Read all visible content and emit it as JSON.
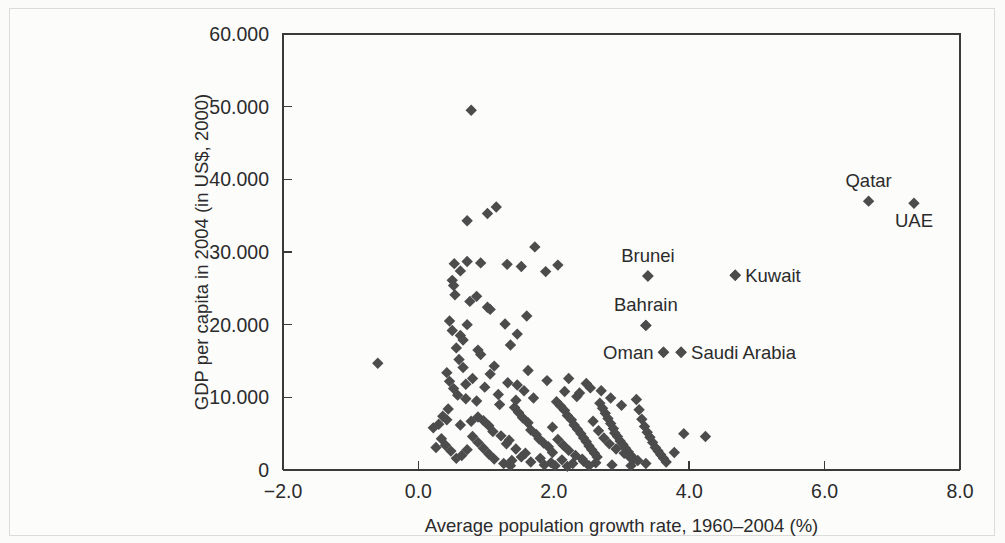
{
  "chart_data": {
    "type": "scatter",
    "title": "",
    "xlabel": "Average population growth rate, 1960–2004 (%)",
    "ylabel": "GDP per capita in 2004 (in US$, 2000)",
    "xlim": [
      -2.0,
      8.0
    ],
    "ylim": [
      0,
      60000
    ],
    "xticks": [
      -2.0,
      0.0,
      2.0,
      4.0,
      6.0,
      8.0
    ],
    "xtick_labels": [
      "−2.0",
      "0.0",
      "2.0",
      "4.0",
      "6.0",
      "8.0"
    ],
    "yticks": [
      0,
      10000,
      20000,
      30000,
      40000,
      50000,
      60000
    ],
    "ytick_labels": [
      "0",
      "10.000",
      "20.000",
      "30.000",
      "40.000",
      "50.000",
      "60.000"
    ],
    "grid": false,
    "legend": "none",
    "marker": "diamond",
    "marker_color": "#4c4c4c",
    "marker_size": 9,
    "annotations": [
      {
        "label": "Qatar",
        "x": 6.65,
        "y": 37000,
        "position": "above"
      },
      {
        "label": "UAE",
        "x": 7.32,
        "y": 36700,
        "position": "below"
      },
      {
        "label": "Brunei",
        "x": 3.39,
        "y": 26700,
        "position": "above"
      },
      {
        "label": "Kuwait",
        "x": 4.68,
        "y": 26800,
        "position": "right"
      },
      {
        "label": "Bahrain",
        "x": 3.36,
        "y": 19900,
        "position": "above"
      },
      {
        "label": "Oman",
        "x": 3.62,
        "y": 16200,
        "position": "left"
      },
      {
        "label": "Saudi Arabia",
        "x": 3.88,
        "y": 16200,
        "position": "right"
      }
    ],
    "points": [
      [
        -0.6,
        14700
      ],
      [
        0.78,
        49500
      ],
      [
        0.72,
        34300
      ],
      [
        1.02,
        35300
      ],
      [
        1.15,
        36200
      ],
      [
        1.72,
        30700
      ],
      [
        0.53,
        28400
      ],
      [
        0.62,
        27400
      ],
      [
        0.72,
        28700
      ],
      [
        0.92,
        28500
      ],
      [
        1.31,
        28300
      ],
      [
        1.52,
        28000
      ],
      [
        2.06,
        28200
      ],
      [
        1.88,
        27300
      ],
      [
        0.5,
        26100
      ],
      [
        0.52,
        25400
      ],
      [
        0.54,
        24100
      ],
      [
        1.02,
        22400
      ],
      [
        1.06,
        22100
      ],
      [
        3.39,
        26700
      ],
      [
        4.68,
        26800
      ],
      [
        3.36,
        19900
      ],
      [
        1.6,
        21200
      ],
      [
        1.28,
        20100
      ],
      [
        1.46,
        18700
      ],
      [
        0.72,
        20000
      ],
      [
        1.36,
        17200
      ],
      [
        3.62,
        16200
      ],
      [
        3.88,
        16200
      ],
      [
        0.62,
        18500
      ],
      [
        0.66,
        17900
      ],
      [
        0.88,
        16500
      ],
      [
        0.92,
        15900
      ],
      [
        1.12,
        14300
      ],
      [
        1.62,
        13700
      ],
      [
        1.32,
        12000
      ],
      [
        1.46,
        11700
      ],
      [
        2.22,
        12600
      ],
      [
        1.18,
        10400
      ],
      [
        1.56,
        10900
      ],
      [
        0.42,
        13400
      ],
      [
        0.46,
        12200
      ],
      [
        0.52,
        11200
      ],
      [
        0.58,
        10300
      ],
      [
        0.7,
        9800
      ],
      [
        0.86,
        9500
      ],
      [
        0.44,
        8400
      ],
      [
        0.3,
        6300
      ],
      [
        0.22,
        5800
      ],
      [
        0.26,
        3100
      ],
      [
        0.62,
        6200
      ],
      [
        0.78,
        6700
      ],
      [
        0.88,
        7300
      ],
      [
        0.96,
        6800
      ],
      [
        1.04,
        6100
      ],
      [
        1.1,
        5300
      ],
      [
        1.22,
        4700
      ],
      [
        1.34,
        4100
      ],
      [
        1.42,
        8600
      ],
      [
        1.48,
        7900
      ],
      [
        1.54,
        7200
      ],
      [
        1.62,
        6500
      ],
      [
        1.66,
        5500
      ],
      [
        1.74,
        4900
      ],
      [
        1.78,
        4300
      ],
      [
        1.85,
        3700
      ],
      [
        1.92,
        3200
      ],
      [
        1.98,
        2400
      ],
      [
        2.04,
        9400
      ],
      [
        2.1,
        8800
      ],
      [
        2.16,
        8200
      ],
      [
        2.2,
        7500
      ],
      [
        2.26,
        6900
      ],
      [
        2.3,
        6200
      ],
      [
        2.35,
        5600
      ],
      [
        2.4,
        5000
      ],
      [
        2.44,
        4400
      ],
      [
        2.48,
        3900
      ],
      [
        2.52,
        3300
      ],
      [
        2.56,
        2800
      ],
      [
        2.6,
        2300
      ],
      [
        2.64,
        1800
      ],
      [
        2.68,
        9200
      ],
      [
        2.72,
        8500
      ],
      [
        2.76,
        7800
      ],
      [
        2.8,
        7100
      ],
      [
        2.84,
        6400
      ],
      [
        2.88,
        5700
      ],
      [
        2.9,
        5100
      ],
      [
        2.94,
        4600
      ],
      [
        2.98,
        4000
      ],
      [
        3.02,
        3500
      ],
      [
        3.06,
        3000
      ],
      [
        3.1,
        2500
      ],
      [
        3.14,
        2000
      ],
      [
        3.18,
        1500
      ],
      [
        3.22,
        9700
      ],
      [
        3.26,
        8300
      ],
      [
        3.3,
        7000
      ],
      [
        3.34,
        6000
      ],
      [
        3.38,
        5200
      ],
      [
        3.42,
        4500
      ],
      [
        3.46,
        3800
      ],
      [
        3.5,
        3100
      ],
      [
        3.54,
        2600
      ],
      [
        3.58,
        2100
      ],
      [
        3.62,
        1600
      ],
      [
        3.66,
        1100
      ],
      [
        3.78,
        2400
      ],
      [
        3.92,
        5000
      ],
      [
        4.24,
        4600
      ],
      [
        2.62,
        1000
      ],
      [
        2.44,
        1200
      ],
      [
        2.28,
        900
      ],
      [
        2.12,
        1400
      ],
      [
        1.96,
        1000
      ],
      [
        1.8,
        1600
      ],
      [
        1.66,
        1100
      ],
      [
        1.52,
        1800
      ],
      [
        1.38,
        1300
      ],
      [
        1.26,
        900
      ],
      [
        1.12,
        1500
      ],
      [
        1.04,
        2200
      ],
      [
        0.96,
        3000
      ],
      [
        0.88,
        3800
      ],
      [
        0.8,
        4600
      ],
      [
        0.72,
        2800
      ],
      [
        0.64,
        2000
      ],
      [
        0.56,
        1600
      ],
      [
        0.48,
        2600
      ],
      [
        0.4,
        3400
      ],
      [
        0.34,
        4300
      ],
      [
        0.7,
        11800
      ],
      [
        0.8,
        12600
      ],
      [
        0.98,
        11400
      ],
      [
        1.2,
        9000
      ],
      [
        1.44,
        9600
      ],
      [
        1.7,
        9900
      ],
      [
        2.34,
        10100
      ],
      [
        2.38,
        10600
      ],
      [
        1.06,
        13200
      ],
      [
        0.6,
        15200
      ],
      [
        0.66,
        14100
      ],
      [
        0.56,
        16800
      ],
      [
        0.5,
        19200
      ],
      [
        0.46,
        20500
      ],
      [
        0.76,
        23200
      ],
      [
        0.86,
        23900
      ],
      [
        2.48,
        11900
      ],
      [
        2.54,
        11300
      ],
      [
        1.9,
        12300
      ],
      [
        2.7,
        10900
      ],
      [
        2.84,
        9900
      ],
      [
        3.0,
        8900
      ],
      [
        2.16,
        10800
      ],
      [
        1.3,
        3600
      ],
      [
        1.44,
        2900
      ],
      [
        1.58,
        2300
      ],
      [
        0.36,
        7400
      ],
      [
        0.42,
        6900
      ],
      [
        1.98,
        5900
      ],
      [
        2.06,
        4200
      ],
      [
        2.14,
        3400
      ],
      [
        2.22,
        2700
      ],
      [
        2.32,
        2000
      ],
      [
        2.42,
        1500
      ],
      [
        2.58,
        6700
      ],
      [
        2.66,
        5400
      ],
      [
        2.74,
        4400
      ],
      [
        2.82,
        3600
      ],
      [
        2.92,
        2900
      ],
      [
        3.04,
        2300
      ],
      [
        3.12,
        1800
      ],
      [
        3.24,
        1300
      ],
      [
        3.36,
        900
      ],
      [
        1.86,
        700
      ],
      [
        2.02,
        600
      ],
      [
        2.2,
        500
      ],
      [
        2.52,
        600
      ],
      [
        2.86,
        700
      ],
      [
        3.14,
        600
      ],
      [
        1.36,
        600
      ]
    ]
  }
}
